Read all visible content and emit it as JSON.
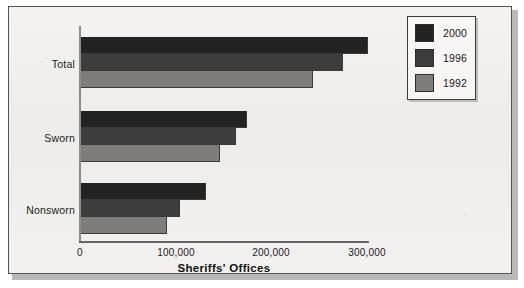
{
  "figure": {
    "caption_title": "Sheriffs' Offices"
  },
  "legend": {
    "position": "top-right",
    "entries": [
      {
        "label": "2000",
        "color": "#232323",
        "swatch_name": "legend-swatch-2000"
      },
      {
        "label": "1996",
        "color": "#3e3d3d",
        "swatch_name": "legend-swatch-1996"
      },
      {
        "label": "1992",
        "color": "#7e7d7c",
        "swatch_name": "legend-swatch-1992"
      }
    ]
  },
  "axes": {
    "x_title": "Sheriffs' Offices",
    "x_ticks": [
      "0",
      "100,000",
      "200,000",
      "300,000"
    ],
    "y_categories": [
      "Total",
      "Sworn",
      "Nonsworn"
    ]
  },
  "chart_data": {
    "type": "bar",
    "orientation": "horizontal",
    "title": "",
    "xlabel": "Sheriffs' Offices",
    "ylabel": "",
    "categories": [
      "Total",
      "Sworn",
      "Nonsworn"
    ],
    "series": [
      {
        "name": "2000",
        "color": "#232323",
        "values": [
          300000,
          173000,
          131000
        ]
      },
      {
        "name": "1996",
        "color": "#3e3d3d",
        "values": [
          274000,
          162000,
          104000
        ]
      },
      {
        "name": "1992",
        "color": "#7e7d7c",
        "values": [
          242000,
          145000,
          90000
        ]
      }
    ],
    "xlim": [
      0,
      300000
    ],
    "xtick_values": [
      0,
      100000,
      200000,
      300000
    ],
    "xtick_labels": [
      "0",
      "100,000",
      "200,000",
      "300,000"
    ],
    "grid": false,
    "legend_position": "top-right",
    "series_order_top_to_bottom": [
      "2000",
      "1996",
      "1992"
    ]
  }
}
